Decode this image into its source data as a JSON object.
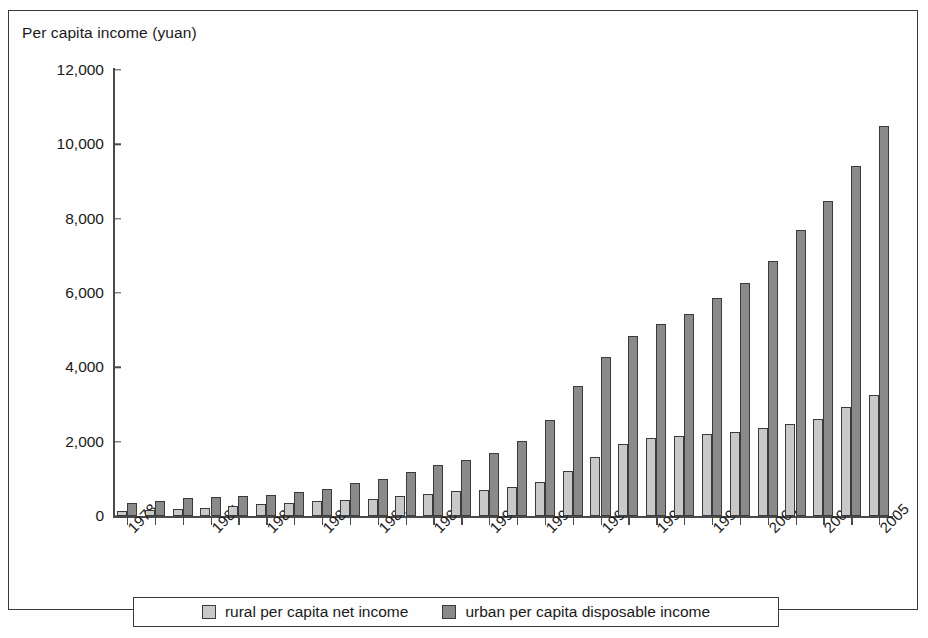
{
  "figure": {
    "title": "Per capita income (yuan)"
  },
  "legend": {
    "items": [
      {
        "key": "rural",
        "label": "rural per capita net income",
        "color": "#c9c9c9"
      },
      {
        "key": "urban",
        "label": "urban per capita disposable income",
        "color": "#8a8a8a"
      }
    ]
  },
  "chart_data": {
    "type": "bar",
    "title": "Per capita income (yuan)",
    "xlabel": "",
    "ylabel": "Per capita income (yuan)",
    "ylim": [
      0,
      12000
    ],
    "yticks": [
      0,
      2000,
      4000,
      6000,
      8000,
      10000,
      12000
    ],
    "ytick_labels": [
      "0",
      "2,000",
      "4,000",
      "6,000",
      "8,000",
      "10,000",
      "12,000"
    ],
    "grid": false,
    "legend_position": "bottom",
    "categories": [
      "1978",
      "1979",
      "1980",
      "1981",
      "1982",
      "1983",
      "1984",
      "1985",
      "1986",
      "1987",
      "1988",
      "1989",
      "1990",
      "1991",
      "1992",
      "1993",
      "1994",
      "1995",
      "1996",
      "1997",
      "1998",
      "1999",
      "2000",
      "2001",
      "2002",
      "2003",
      "2004",
      "2005"
    ],
    "visible_tick_labels": [
      "1978",
      "1981",
      "1983",
      "1985",
      "1987",
      "1989",
      "1991",
      "1993",
      "1995",
      "1997",
      "1999",
      "2001",
      "2003",
      "2005"
    ],
    "series": [
      {
        "name": "rural per capita net income",
        "color": "#c9c9c9",
        "values": [
          134,
          160,
          191,
          223,
          270,
          310,
          355,
          398,
          424,
          463,
          545,
          602,
          686,
          709,
          784,
          922,
          1221,
          1578,
          1926,
          2090,
          2162,
          2210,
          2253,
          2366,
          2476,
          2622,
          2936,
          3255
        ]
      },
      {
        "name": "urban per capita disposable income",
        "color": "#8a8a8a",
        "values": [
          343,
          405,
          478,
          500,
          535,
          565,
          652,
          739,
          900,
          1002,
          1181,
          1376,
          1510,
          1701,
          2027,
          2577,
          3496,
          4283,
          4839,
          5160,
          5425,
          5854,
          6280,
          6860,
          7703,
          8472,
          9422,
          10493
        ]
      }
    ]
  }
}
